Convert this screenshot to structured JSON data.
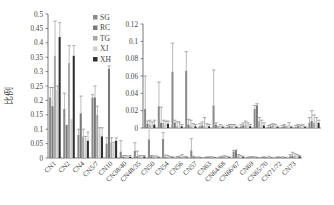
{
  "chart_data": [
    {
      "id": "main",
      "type": "bar",
      "title": "",
      "xlabel": "",
      "ylabel": "比例",
      "ylim": [
        0,
        0.5
      ],
      "yticks": [
        0,
        0.05,
        0.1,
        0.15,
        0.2,
        0.25,
        0.3,
        0.35,
        0.4,
        0.45,
        0.5
      ],
      "ytick_labels": [
        "0",
        "0.05",
        "0.1",
        "0.15",
        "0.2",
        "0.25",
        "0.3",
        "0.35",
        "0.4",
        "0.45",
        "0.5"
      ],
      "grid": false,
      "legend_position": "upper-left-inside",
      "error_bars": true,
      "categories": [
        "CN1",
        "CN2",
        "CN4",
        "CN5/7",
        "CN10",
        "CN38/40",
        "CN48/35",
        "CN50",
        "CN54",
        "CN56",
        "CN57",
        "CN63",
        "CN64/68",
        "CN66/67",
        "CN69",
        "CN65/70",
        "CN71/72",
        "CN73"
      ],
      "series": [
        {
          "name": "SG",
          "color": "#8a8a8a",
          "values": [
            0.21,
            0.17,
            0.08,
            0.21,
            0.05,
            0.022,
            0.025,
            0.065,
            0.066,
            0.002,
            0.026,
            0.001,
            0.002,
            0.022,
            0.001,
            0.001,
            0.001,
            0.006
          ],
          "errors": [
            0.035,
            0.055,
            0.02,
            0.01,
            0.02,
            0.038,
            0.028,
            0.033,
            0.022,
            0.003,
            0.041,
            0.002,
            0.002,
            0.004,
            0.002,
            0.002,
            0.002,
            0.006
          ]
        },
        {
          "name": "RC",
          "color": "#7a7a7a",
          "values": [
            0.18,
            0.115,
            0.155,
            0.21,
            0.31,
            0.005,
            0.006,
            0.006,
            0.004,
            0.003,
            0.004,
            0.002,
            0.003,
            0.026,
            0.002,
            0.002,
            0.002,
            0.008
          ],
          "errors": [
            0.065,
            0.0,
            0.06,
            0.04,
            0.01,
            0.003,
            0.018,
            0.003,
            0.006,
            0.004,
            0.002,
            0.002,
            0.003,
            0.002,
            0.002,
            0.002,
            0.002,
            0.012
          ]
        },
        {
          "name": "TG",
          "color": "#a8a8a8",
          "values": [
            0.355,
            0.33,
            0.075,
            0.15,
            0.055,
            0.004,
            0.006,
            0.002,
            0.002,
            0.002,
            0.001,
            0.002,
            0.004,
            0.008,
            0.003,
            0.001,
            0.002,
            0.006
          ],
          "errors": [
            0.12,
            0.06,
            0.025,
            0.03,
            0.015,
            0.005,
            0.003,
            0.005,
            0.007,
            0.01,
            0.001,
            0.002,
            0.004,
            0.004,
            0.002,
            0.001,
            0.001,
            0.009
          ]
        },
        {
          "name": "XJ",
          "color": "#d0d0d0",
          "values": [
            0.235,
            0.135,
            0.065,
            0.085,
            0.045,
            0.003,
            0.004,
            0.003,
            0.002,
            0.002,
            0.002,
            0.002,
            0.003,
            0.004,
            0.002,
            0.003,
            0.002,
            0.008
          ],
          "errors": [
            0.015,
            0.0,
            0.01,
            0.02,
            0.01,
            0.004,
            0.004,
            0.004,
            0.003,
            0.003,
            0.002,
            0.002,
            0.003,
            0.005,
            0.002,
            0.003,
            0.002,
            0.004
          ]
        },
        {
          "name": "XH",
          "color": "#303030",
          "values": [
            0.42,
            0.355,
            0.06,
            0.075,
            0.06,
            0.004,
            0.005,
            0.002,
            0.002,
            0.002,
            0.001,
            0.001,
            0.002,
            0.003,
            0.001,
            0.001,
            0.001,
            0.006
          ],
          "errors": [
            0.05,
            0.035,
            0.03,
            0.03,
            0.01,
            0.005,
            0.003,
            0.002,
            0.002,
            0.002,
            0.001,
            0.001,
            0.002,
            0.003,
            0.001,
            0.001,
            0.001,
            0.003
          ]
        }
      ]
    },
    {
      "id": "inset",
      "type": "bar",
      "title": "",
      "xlabel": "",
      "ylabel": "",
      "ylim": [
        0,
        0.12
      ],
      "yticks": [
        0,
        0.02,
        0.04,
        0.06,
        0.08,
        0.1,
        0.12
      ],
      "ytick_labels": [
        "0",
        "0.02",
        "0.04",
        "0.06",
        "0.08",
        "0.1",
        "0.12"
      ],
      "grid": false,
      "note": "Zoomed view of categories CN38/40 through CN73",
      "categories": [
        "CN38/40",
        "CN48/35",
        "CN50",
        "CN54",
        "CN56",
        "CN57",
        "CN63",
        "CN64/68",
        "CN66/67",
        "CN69",
        "CN65/70",
        "CN71/72",
        "CN73"
      ],
      "series_ref": "main"
    }
  ],
  "legend": [
    {
      "label": "SG",
      "color": "#8a8a8a"
    },
    {
      "label": "RC",
      "color": "#7a7a7a"
    },
    {
      "label": "TG",
      "color": "#a8a8a8"
    },
    {
      "label": "XJ",
      "color": "#d0d0d0"
    },
    {
      "label": "XH",
      "color": "#303030"
    }
  ],
  "axis_label_y": "比例"
}
